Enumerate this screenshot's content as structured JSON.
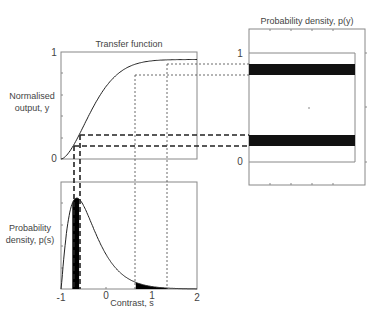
{
  "transfer_plot": {
    "title": "Transfer function",
    "ylabel_line1": "Normalised",
    "ylabel_line2": "output, y",
    "ytick_top": "1",
    "ytick_bottom": "0"
  },
  "density_s_plot": {
    "ylabel_line1": "Probability",
    "ylabel_line2": "density, p(s)",
    "xlabel": "Contrast, s",
    "xticks": [
      "-1",
      "0",
      "1",
      "2"
    ]
  },
  "density_y_plot": {
    "title": "Probability density, p(y)",
    "ytick_top": "1",
    "ytick_bottom": "0"
  },
  "chart_data": {
    "type": "diagram",
    "x_range": [
      -1,
      2
    ],
    "y_range": [
      0,
      1
    ],
    "low_band_s": [
      -0.75,
      -0.6
    ],
    "high_band_s": [
      0.65,
      1.35
    ],
    "low_band_y": [
      0.13,
      0.23
    ],
    "high_band_y": [
      0.83,
      0.91
    ]
  }
}
